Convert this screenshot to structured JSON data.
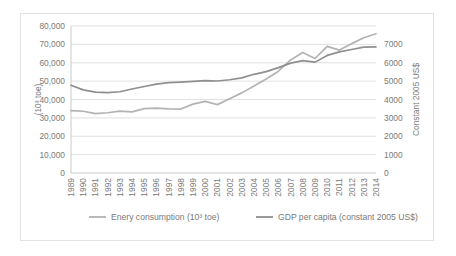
{
  "chart_data": {
    "type": "line",
    "title": "",
    "xlabel": "",
    "ylabel": "(10³ toe)",
    "y2label": "Constant 2005 US$",
    "grid": true,
    "legend_position": "bottom",
    "ylim": [
      0,
      80000
    ],
    "y2lim": [
      0,
      7000
    ],
    "yticks": [
      "0",
      "10,000",
      "20,000",
      "30,000",
      "40,000",
      "50,000",
      "60,000",
      "70,000",
      "80,000"
    ],
    "ytick_values": [
      0,
      10000,
      20000,
      30000,
      40000,
      50000,
      60000,
      70000,
      80000
    ],
    "y2ticks": [
      "0",
      "1000",
      "2000",
      "3000",
      "4000",
      "5000",
      "6000",
      "7000"
    ],
    "y2tick_values": [
      0,
      1000,
      2000,
      3000,
      4000,
      5000,
      6000,
      7000
    ],
    "categories": [
      "1989",
      "1990",
      "1991",
      "1992",
      "1993",
      "1994",
      "1995",
      "1996",
      "1997",
      "1998",
      "1999",
      "2000",
      "2001",
      "2002",
      "2003",
      "2004",
      "2005",
      "2006",
      "2007",
      "2008",
      "2009",
      "2010",
      "2011",
      "2012",
      "2013",
      "2014"
    ],
    "series": [
      {
        "name": "Enery consumption (10³ toe)",
        "axis": "left",
        "color": "#b3b3b3",
        "values": [
          34000,
          33600,
          32300,
          32800,
          33700,
          33300,
          35000,
          35300,
          34900,
          34800,
          37500,
          39000,
          37200,
          40400,
          43600,
          47300,
          51200,
          55400,
          61500,
          65600,
          62300,
          68900,
          66900,
          70400,
          73600,
          75800
        ]
      },
      {
        "name": "GDP per capita (constant 2005 US$)",
        "axis": "right",
        "color": "#8f8f8f",
        "values": [
          4180,
          3960,
          3850,
          3830,
          3870,
          4000,
          4120,
          4230,
          4300,
          4330,
          4360,
          4400,
          4380,
          4440,
          4530,
          4700,
          4830,
          5020,
          5230,
          5350,
          5280,
          5600,
          5770,
          5880,
          5990,
          6010
        ]
      }
    ]
  }
}
